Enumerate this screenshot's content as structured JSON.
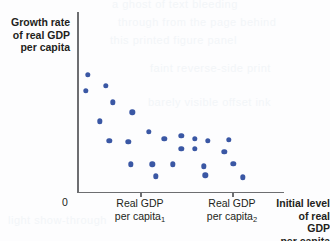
{
  "figure": {
    "background_color": "#fdfdfe",
    "axis_color": "#6d6e71",
    "text_color": "#231f20",
    "point_color": "#3a57a4"
  },
  "axes": {
    "y_label_line1": "Growth rate",
    "y_label_line2": "of real GDP",
    "y_label_line3": "per capita",
    "origin_label": "0",
    "x_title_line1": "Initial level",
    "x_title_line2": "of real GDP",
    "x_title_line3": "per capita",
    "x_tick_1_line1": "Real GDP",
    "x_tick_1_line2": "per capita",
    "x_tick_1_sub": "1",
    "x_tick_2_line1": "Real GDP",
    "x_tick_2_line2": "per capita",
    "x_tick_2_sub": "2"
  },
  "ghost_text": {
    "g1": "a ghost of text bleeding",
    "g2": "through from the page behind",
    "g3": "this printed figure panel",
    "g4": "faint reverse-side print",
    "g5": "barely visible offset ink",
    "g6": "light show-through"
  },
  "chart_data": {
    "type": "scatter",
    "title": "",
    "xlabel": "Initial level of real GDP per capita",
    "ylabel": "Growth rate of real GDP per capita",
    "grid": false,
    "legend": null,
    "xlim": [
      0,
      100
    ],
    "ylim": [
      0,
      100
    ],
    "x_tick_positions": [
      30.5,
      74.9
    ],
    "x_tick_labels": [
      "Real GDP per capita₁",
      "Real GDP per capita₂"
    ],
    "y_tick_positions": [],
    "y_tick_labels": [],
    "annotation": "Negative relationship: countries starting with lower real GDP per capita tend to show higher growth rates of real GDP per capita (convergence).",
    "points": [
      {
        "x": 5.3,
        "y": 65.7
      },
      {
        "x": 4.3,
        "y": 56.9
      },
      {
        "x": 14.0,
        "y": 59.7
      },
      {
        "x": 17.2,
        "y": 50.3
      },
      {
        "x": 26.8,
        "y": 44.8
      },
      {
        "x": 11.1,
        "y": 39.8
      },
      {
        "x": 34.6,
        "y": 33.7
      },
      {
        "x": 15.6,
        "y": 28.7
      },
      {
        "x": 24.7,
        "y": 28.2
      },
      {
        "x": 42.2,
        "y": 29.8
      },
      {
        "x": 50.3,
        "y": 31.5
      },
      {
        "x": 57.0,
        "y": 29.8
      },
      {
        "x": 63.3,
        "y": 28.7
      },
      {
        "x": 73.4,
        "y": 29.3
      },
      {
        "x": 50.3,
        "y": 24.3
      },
      {
        "x": 57.0,
        "y": 24.3
      },
      {
        "x": 71.2,
        "y": 22.7
      },
      {
        "x": 75.5,
        "y": 16.0
      },
      {
        "x": 36.3,
        "y": 15.5
      },
      {
        "x": 46.4,
        "y": 15.5
      },
      {
        "x": 26.0,
        "y": 15.5
      },
      {
        "x": 61.2,
        "y": 14.4
      },
      {
        "x": 38.0,
        "y": 8.8
      },
      {
        "x": 62.0,
        "y": 9.4
      },
      {
        "x": 80.0,
        "y": 8.3
      }
    ]
  }
}
